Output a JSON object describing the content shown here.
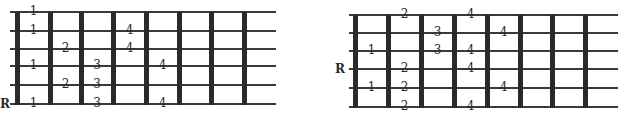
{
  "diagrams": [
    {
      "id": "left",
      "root_label": "R",
      "root_string": 6,
      "string_y": [
        12,
        31,
        49,
        66,
        85,
        104
      ],
      "fret_x": [
        17,
        50,
        81,
        113,
        146,
        179,
        211,
        244
      ],
      "string_start_x": 10,
      "string_end_x": 276,
      "root_label_pos": {
        "x": 0,
        "y": 98
      },
      "fingers": [
        {
          "string": 1,
          "space": 1,
          "label": "1"
        },
        {
          "string": 2,
          "space": 1,
          "label": "1"
        },
        {
          "string": 2,
          "space": 4,
          "label": "4"
        },
        {
          "string": 3,
          "space": 2,
          "label": "2"
        },
        {
          "string": 3,
          "space": 4,
          "label": "4"
        },
        {
          "string": 4,
          "space": 1,
          "label": "1"
        },
        {
          "string": 4,
          "space": 3,
          "label": "3"
        },
        {
          "string": 4,
          "space": 5,
          "label": "4"
        },
        {
          "string": 5,
          "space": 2,
          "label": "2"
        },
        {
          "string": 5,
          "space": 3,
          "label": "3"
        },
        {
          "string": 6,
          "space": 1,
          "label": "1"
        },
        {
          "string": 6,
          "space": 3,
          "label": "3"
        },
        {
          "string": 6,
          "space": 5,
          "label": "4"
        }
      ]
    },
    {
      "id": "right",
      "root_label": "R",
      "root_string": 4,
      "string_y": [
        15,
        33,
        51,
        69,
        88,
        107
      ],
      "fret_x": [
        355,
        388,
        421,
        454,
        487,
        520,
        552,
        585
      ],
      "string_start_x": 349,
      "string_end_x": 618,
      "root_label_pos": {
        "x": 335,
        "y": 63
      },
      "fingers": [
        {
          "string": 1,
          "space": 2,
          "label": "2"
        },
        {
          "string": 1,
          "space": 4,
          "label": "4"
        },
        {
          "string": 2,
          "space": 3,
          "label": "3"
        },
        {
          "string": 2,
          "space": 5,
          "label": "4"
        },
        {
          "string": 3,
          "space": 1,
          "label": "1"
        },
        {
          "string": 3,
          "space": 3,
          "label": "3"
        },
        {
          "string": 3,
          "space": 4,
          "label": "4"
        },
        {
          "string": 4,
          "space": 2,
          "label": "2"
        },
        {
          "string": 4,
          "space": 4,
          "label": "4"
        },
        {
          "string": 5,
          "space": 1,
          "label": "1"
        },
        {
          "string": 5,
          "space": 2,
          "label": "2"
        },
        {
          "string": 5,
          "space": 5,
          "label": "4"
        },
        {
          "string": 6,
          "space": 2,
          "label": "2"
        },
        {
          "string": 6,
          "space": 4,
          "label": "4"
        }
      ]
    }
  ],
  "colors": {
    "ink": "#2a2a2a",
    "string": "#3a3a3a",
    "background": "#ffffff"
  }
}
